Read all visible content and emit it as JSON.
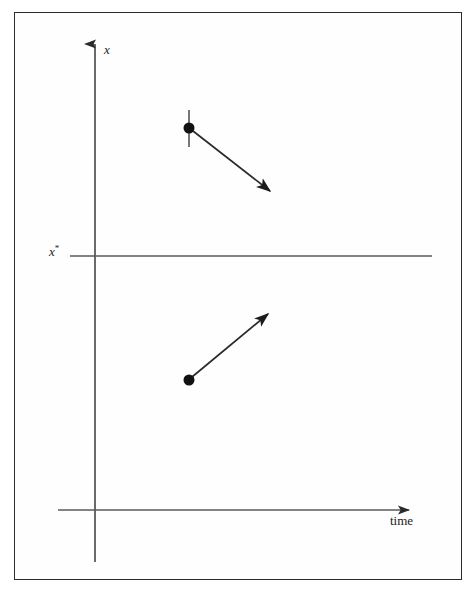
{
  "figure": {
    "kind": "stability-phase-diagram",
    "background_color": "#ffffff",
    "frame_color": "#2b2b2b",
    "line_color": "#4a4a4a",
    "ink_color": "#1c1c1c"
  },
  "axes": {
    "vertical": {
      "label": "x",
      "label_style": "italic",
      "name": "x-axis",
      "arrow": "up",
      "x": 95,
      "y_top": 36,
      "y_bottom": 562
    },
    "horizontal": {
      "label": "time",
      "label_style": "roman",
      "name": "time-axis",
      "arrow": "right",
      "y": 510,
      "x_left": 58,
      "x_right": 420
    }
  },
  "equilibrium": {
    "label": "x",
    "superscript": "*",
    "label_full": "x*",
    "line_y": 256,
    "line_x_start": 70,
    "line_x_end": 432
  },
  "trajectories": [
    {
      "name": "upper-trajectory",
      "description": "initial condition above equilibrium, moving down toward x*",
      "start_point": {
        "x": 189,
        "y": 128
      },
      "end_point": {
        "x": 281,
        "y": 200
      },
      "direction": "down-right",
      "has_tick": true,
      "tick": {
        "x": 189,
        "y_top": 110,
        "y_bottom": 147
      },
      "dot_radius": 5.5
    },
    {
      "name": "lower-trajectory",
      "description": "initial condition below equilibrium, moving up toward x*",
      "start_point": {
        "x": 189,
        "y": 380
      },
      "end_point": {
        "x": 279,
        "y": 304
      },
      "direction": "up-right",
      "has_tick": false,
      "dot_radius": 5.5
    }
  ]
}
